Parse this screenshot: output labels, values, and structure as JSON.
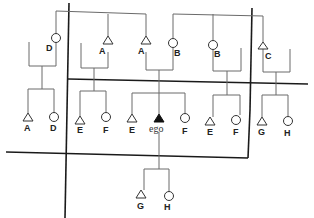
{
  "diagram": {
    "type": "kinship-chart",
    "colors": {
      "line": "#6a6a6a",
      "divider": "#1a1a1a",
      "ego_fill": "#111111",
      "symbol_fill": "#ffffff"
    },
    "generations": {
      "g_plus_1": [
        {
          "id": "p1",
          "sex": "female",
          "label": "D"
        },
        {
          "id": "p2",
          "sex": "male",
          "label": "A"
        },
        {
          "id": "p3",
          "sex": "male",
          "label": "A"
        },
        {
          "id": "p4",
          "sex": "female",
          "label": "B"
        },
        {
          "id": "p5",
          "sex": "female",
          "label": "B"
        },
        {
          "id": "p6",
          "sex": "male",
          "label": "C"
        }
      ],
      "g_0": [
        {
          "id": "c1",
          "sex": "male",
          "label": "A"
        },
        {
          "id": "c2",
          "sex": "female",
          "label": "D"
        },
        {
          "id": "c3",
          "sex": "male",
          "label": "E"
        },
        {
          "id": "c4",
          "sex": "female",
          "label": "F"
        },
        {
          "id": "c5",
          "sex": "male",
          "label": "E"
        },
        {
          "id": "ego",
          "sex": "male",
          "label": "ego",
          "is_ego": true
        },
        {
          "id": "c6",
          "sex": "female",
          "label": "F"
        },
        {
          "id": "c7",
          "sex": "male",
          "label": "E"
        },
        {
          "id": "c8",
          "sex": "female",
          "label": "F"
        },
        {
          "id": "c9",
          "sex": "male",
          "label": "G"
        },
        {
          "id": "c10",
          "sex": "female",
          "label": "H"
        }
      ],
      "g_minus_1": [
        {
          "id": "k1",
          "sex": "male",
          "label": "G"
        },
        {
          "id": "k2",
          "sex": "female",
          "label": "H"
        }
      ]
    }
  }
}
